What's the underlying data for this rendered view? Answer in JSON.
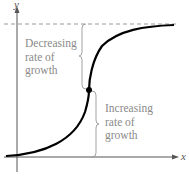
{
  "axes": {
    "x_label": "x",
    "y_label": "y"
  },
  "annotations": {
    "upper": {
      "line1": "Decreasing",
      "line2": "rate of",
      "line3": "growth"
    },
    "lower": {
      "line1": "Increasing",
      "line2": "rate of",
      "line3": "growth"
    }
  },
  "colors": {
    "curve": "#000000",
    "axis": "#555555",
    "text": "#8a8a8a",
    "asymptote": "#9a9a9a"
  }
}
